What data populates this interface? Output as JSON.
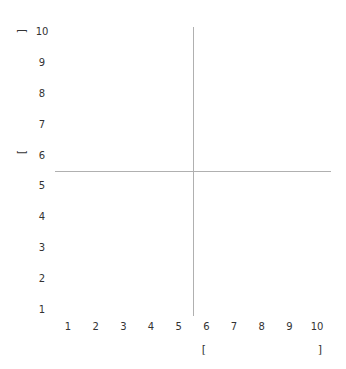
{
  "chart_data": {
    "type": "scatter",
    "title": "",
    "xlabel": "[                    ]",
    "ylabel": "[                    ]",
    "xlim": [
      1,
      10
    ],
    "ylim": [
      1,
      10
    ],
    "x_ticks": [
      "1",
      "2",
      "3",
      "4",
      "5",
      "6",
      "7",
      "8",
      "9",
      "10"
    ],
    "y_ticks": [
      "1",
      "2",
      "3",
      "4",
      "5",
      "6",
      "7",
      "8",
      "9",
      "10"
    ],
    "grid": false,
    "series": [],
    "crosshair": {
      "x": 5.5,
      "y": 5.5,
      "color": "#b0b0b0"
    }
  },
  "labels": {
    "x_open": "[",
    "x_close": "]",
    "y_open": "[",
    "y_close": "]"
  }
}
